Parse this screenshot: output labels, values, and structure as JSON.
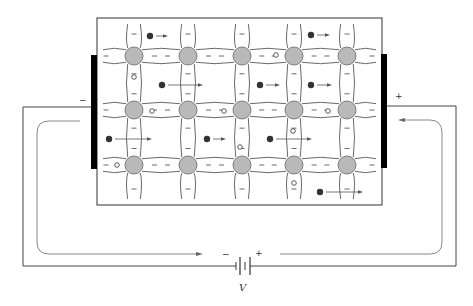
{
  "figure": {
    "crystal": {
      "box": {
        "x": 97,
        "y": 18,
        "width": 285,
        "height": 187
      },
      "atom_columns_x": [
        134,
        188,
        242,
        294,
        347
      ],
      "atom_rows_y": [
        56,
        110,
        165
      ],
      "atom_radius": 9,
      "atom_color": "#b9b9b9",
      "bond_charge_symbol": "−"
    },
    "electrodes": {
      "left": {
        "x": 91,
        "y": 55,
        "width": 6,
        "height": 114,
        "polarity": "−"
      },
      "right": {
        "x": 381,
        "y": 54,
        "width": 6,
        "height": 114,
        "polarity": "+"
      }
    },
    "electrons": [
      {
        "x": 150,
        "y": 36,
        "arrow_to": 168
      },
      {
        "x": 162,
        "y": 85,
        "arrow_to": 203
      },
      {
        "x": 311,
        "y": 35,
        "arrow_to": 330
      },
      {
        "x": 260,
        "y": 85,
        "arrow_to": 280
      },
      {
        "x": 311,
        "y": 85,
        "arrow_to": 332
      },
      {
        "x": 109,
        "y": 139,
        "arrow_to": 152
      },
      {
        "x": 207,
        "y": 139,
        "arrow_to": 226
      },
      {
        "x": 270,
        "y": 139,
        "arrow_to": 312
      },
      {
        "x": 320,
        "y": 192,
        "arrow_to": 363
      }
    ],
    "holes": [
      {
        "x": 134,
        "y": 77
      },
      {
        "x": 276,
        "y": 55
      },
      {
        "x": 152,
        "y": 111
      },
      {
        "x": 224,
        "y": 111
      },
      {
        "x": 328,
        "y": 111
      },
      {
        "x": 240,
        "y": 147
      },
      {
        "x": 293,
        "y": 131
      },
      {
        "x": 117,
        "y": 165
      },
      {
        "x": 294,
        "y": 183
      }
    ],
    "labels": {
      "left_electrode_sign": "−",
      "right_electrode_sign": "+",
      "battery_minus": "−",
      "battery_plus": "+",
      "battery_voltage": "V"
    },
    "colors": {
      "line": "#333333",
      "electron": "#333333",
      "electrode": "#000000",
      "current_arrow": "#777777"
    }
  }
}
